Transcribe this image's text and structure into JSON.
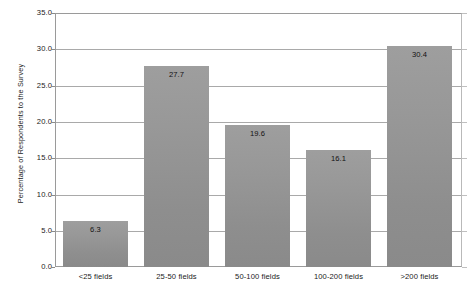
{
  "chart_data": {
    "type": "bar",
    "title": "",
    "subtitle": "",
    "xlabel": "",
    "ylabel": "Percentage of Respondents to the Survey",
    "categories": [
      "<25 fields",
      "25-50 fields",
      "50-100 fields",
      "100-200 fields",
      ">200 fields"
    ],
    "values": [
      6.3,
      19.6,
      27.7,
      16.1,
      30.4
    ],
    "series": [
      {
        "name": "Percentage of Respondents to the Survey",
        "values": [
          6.3,
          27.7,
          19.6,
          16.1,
          30.4
        ]
      }
    ],
    "data_labels": [
      "6.3",
      "27.7",
      "19.6",
      "16.1",
      "30.4"
    ],
    "ylim": [
      0.0,
      35.0
    ],
    "ytick_values": [
      0.0,
      5.0,
      10.0,
      15.0,
      20.0,
      25.0,
      30.0,
      35.0
    ],
    "ytick_labels": [
      "0.0",
      "5.0",
      "10.0",
      "15.0",
      "20.0",
      "25.0",
      "30.0",
      "35.0"
    ],
    "grid": true,
    "grid_axis": "y",
    "legend": false,
    "legend_position": "none",
    "bar_color": "#979797",
    "grid_color": "#a9a9a9",
    "axis_color": "#9a9a9a",
    "background_color": "#ffffff",
    "annotations": []
  },
  "bars": [
    {
      "label": "<25 fields",
      "value_label": "6.3",
      "value": 6.3
    },
    {
      "label": "25-50 fields",
      "value_label": "27.7",
      "value": 27.7
    },
    {
      "label": "50-100 fields",
      "value_label": "19.6",
      "value": 19.6
    },
    {
      "label": "100-200 fields",
      "value_label": "16.1",
      "value": 16.1
    },
    {
      "label": ">200 fields",
      "value_label": "30.4",
      "value": 30.4
    }
  ],
  "yticks": [
    {
      "label": "35.0"
    },
    {
      "label": "30.0"
    },
    {
      "label": "25.0"
    },
    {
      "label": "20.0"
    },
    {
      "label": "15.0"
    },
    {
      "label": "10.0"
    },
    {
      "label": "5.0"
    },
    {
      "label": "0.0"
    }
  ]
}
